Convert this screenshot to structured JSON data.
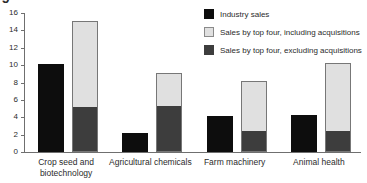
{
  "corner_artifact": "5",
  "chart_data": {
    "type": "bar",
    "title": "",
    "subtitle": "",
    "xlabel": "",
    "ylabel": "",
    "ylim": [
      0,
      16
    ],
    "yticks": [
      0,
      2,
      4,
      6,
      8,
      10,
      12,
      14,
      16
    ],
    "ytick_labels": [
      "0",
      "2",
      "4",
      "6",
      "8",
      "10",
      "12",
      "14",
      "16"
    ],
    "grid": false,
    "legend_position": "top-right",
    "categories": [
      "Crop seed and\nbiotechnology",
      "Agricultural chemicals",
      "Farm machinery",
      "Animal health"
    ],
    "series": [
      {
        "name": "Industry sales",
        "color": "#0d0d0d",
        "style": "separate-bar",
        "values": [
          10.1,
          2.2,
          4.2,
          4.3
        ]
      },
      {
        "name": "Sales by top four, excluding acquisitions",
        "color": "#3d3d3d",
        "style": "stack-lower",
        "values": [
          5.1,
          5.2,
          2.3,
          2.3
        ]
      },
      {
        "name": "Sales by top four, including acquisitions",
        "color": "#e0e0e0",
        "style": "stack-total",
        "values": [
          15.1,
          9.1,
          8.2,
          10.3
        ]
      }
    ],
    "legend": [
      {
        "label": "Industry sales",
        "swatch": "black"
      },
      {
        "label": "Sales by top four, including acquisitions",
        "swatch": "light-gray"
      },
      {
        "label": "Sales by top four, excluding acquisitions",
        "swatch": "dark-gray"
      }
    ]
  }
}
